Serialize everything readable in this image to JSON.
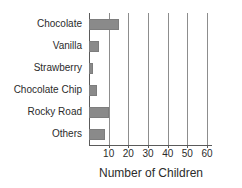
{
  "chart_data": {
    "type": "bar",
    "orientation": "horizontal",
    "title": "",
    "xlabel": "Number of Children",
    "ylabel": "",
    "categories": [
      "Chocolate",
      "Vanilla",
      "Strawberry",
      "Chocolate Chip",
      "Rocky Road",
      "Others"
    ],
    "values": [
      15,
      5,
      2,
      4,
      10,
      8
    ],
    "xlim": [
      0,
      62
    ],
    "xticks": [
      10,
      20,
      30,
      40,
      50,
      60
    ],
    "xtick_labels": [
      "10",
      "20",
      "30",
      "40",
      "50",
      "60"
    ],
    "grid": "vertical",
    "legend": "none",
    "bar_color": "#8a8a8a",
    "axis_color": "#5a5a5a",
    "gridline_color": "#8d8d8d"
  }
}
